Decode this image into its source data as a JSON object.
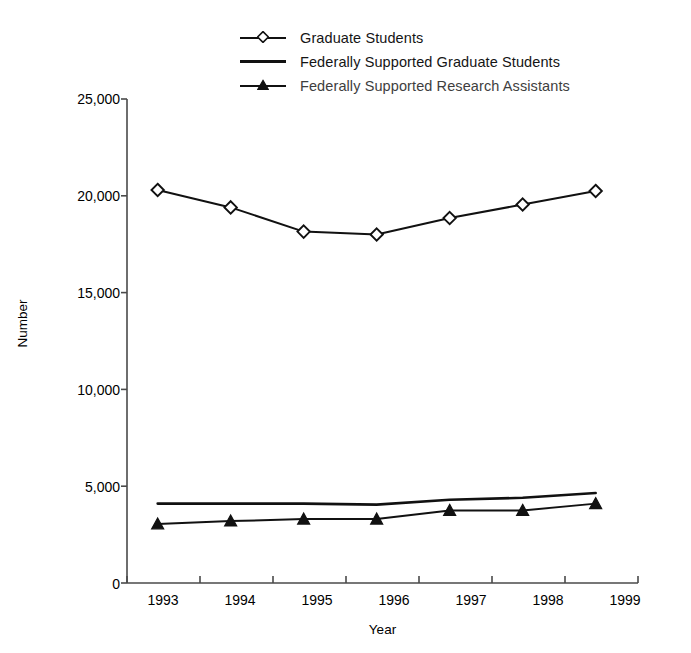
{
  "chart_data": {
    "type": "line",
    "title": "",
    "xlabel": "Year",
    "ylabel": "Number",
    "x": [
      "1993",
      "1994",
      "1995",
      "1996",
      "1997",
      "1998",
      "1999"
    ],
    "categories": [
      "1993",
      "1994",
      "1995",
      "1996",
      "1997",
      "1998",
      "1999"
    ],
    "ylim": [
      0,
      25000
    ],
    "yticks": [
      0,
      5000,
      10000,
      15000,
      20000,
      25000
    ],
    "ytick_labels": [
      "0",
      "5,000",
      "10,000",
      "15,000",
      "20,000",
      "25,000"
    ],
    "grid": false,
    "legend_position": "top-center",
    "series": [
      {
        "name": "Graduate Students",
        "marker": "open-diamond",
        "values": [
          20300,
          19400,
          18150,
          18000,
          18850,
          19550,
          20250
        ]
      },
      {
        "name": "Federally Supported Graduate Students",
        "marker": "none",
        "values": [
          4100,
          4100,
          4100,
          4050,
          4300,
          4400,
          4650
        ]
      },
      {
        "name": "Federally Supported Research Assistants",
        "marker": "filled-triangle",
        "values": [
          3050,
          3200,
          3300,
          3300,
          3750,
          3750,
          4100
        ]
      }
    ]
  },
  "legend": {
    "items": [
      {
        "label": "Graduate Students",
        "marker": "open-diamond-icon"
      },
      {
        "label": "Federally Supported Graduate Students",
        "marker": "plain-line-icon"
      },
      {
        "label": "Federally Supported Research Assistants",
        "marker": "filled-triangle-icon"
      }
    ]
  },
  "axes": {
    "y_title": "Number",
    "x_title": "Year",
    "y_labels": [
      "25,000",
      "20,000",
      "15,000",
      "10,000",
      "5,000",
      "0"
    ],
    "x_labels": [
      "1993",
      "1994",
      "1995",
      "1996",
      "1997",
      "1998",
      "1999"
    ]
  },
  "colors": {
    "line": "#111111",
    "axis": "#4a4a4a",
    "background": "#ffffff",
    "text": "#111111"
  }
}
